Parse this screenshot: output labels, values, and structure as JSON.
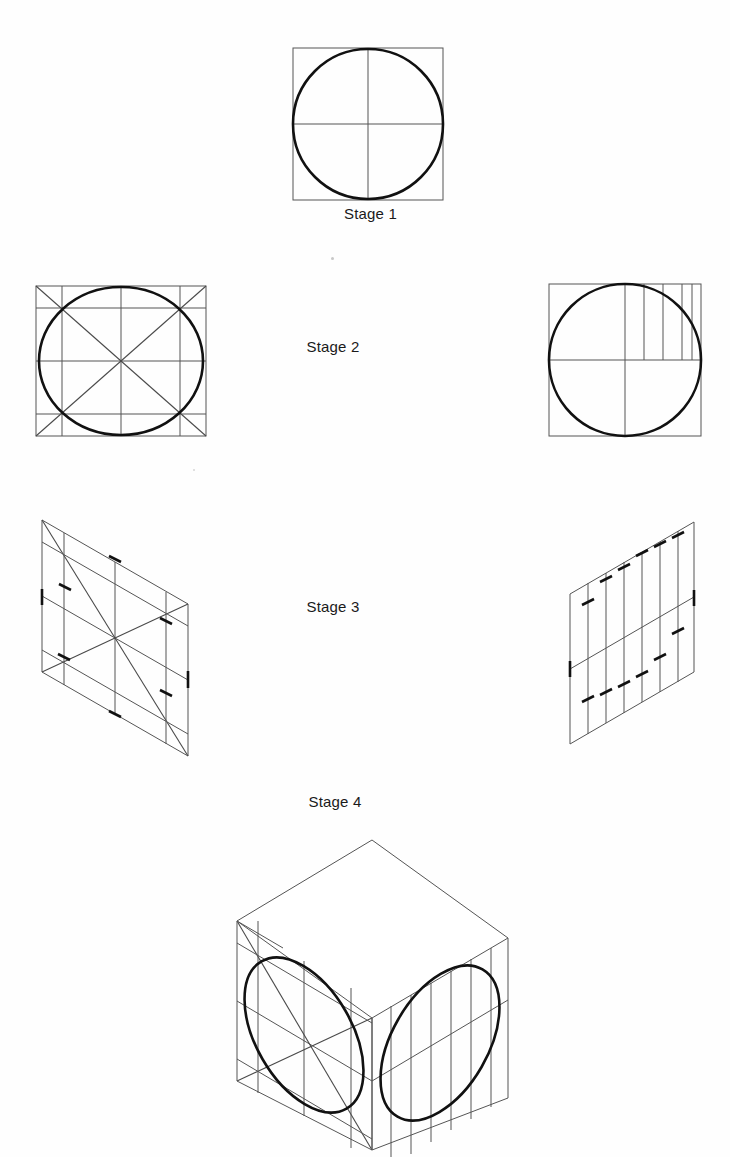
{
  "document": {
    "type": "technical-drawing",
    "subject": "Isometric circle construction by the ordinate (offset) method",
    "background_color": "#fefefe",
    "thin_line_color": "#555555",
    "thick_line_color": "#111111",
    "width": 730,
    "height": 1157
  },
  "stages": [
    {
      "id": "stage-1",
      "label": "Stage 1",
      "description": "True-view square with inscribed circle and centre lines",
      "label_x": 333,
      "label_y": 212,
      "square": {
        "x": 293,
        "y": 48,
        "size": 150
      },
      "circle": {
        "cx": 368,
        "cy": 123,
        "r": 75
      },
      "center_lines": 2
    },
    {
      "id": "stage-2-left",
      "label": "Stage 2",
      "description": "Square with circle, diagonals and corner offset grid",
      "square": {
        "x": 36,
        "y": 286,
        "size": 170
      },
      "circle": {
        "cx": 121,
        "cy": 371,
        "r": 80
      },
      "diagonals": 2,
      "offset_lines": 4
    },
    {
      "id": "stage-2-right",
      "label": "Stage 2",
      "description": "Square with circle, centre lines and vertical ordinates in upper-right quadrant",
      "square": {
        "x": 549,
        "y": 284,
        "size": 152
      },
      "circle": {
        "cx": 625,
        "cy": 360,
        "r": 76
      },
      "ordinates": 4
    },
    {
      "id": "stage-2-center-label",
      "label": "Stage 2",
      "label_x": 333,
      "label_y": 345
    },
    {
      "id": "stage-3-left",
      "label": "Stage 3",
      "description": "Isometric (left-face) rhombus with transferred grid, diagonals and ordinate tick marks",
      "tick_count": 8
    },
    {
      "id": "stage-3-right",
      "label": "Stage 3",
      "description": "Isometric (right-face) rhombus with transferred vertical ordinates and tick marks",
      "tick_count": 12
    },
    {
      "id": "stage-3-center-label",
      "label": "Stage 3",
      "label_x": 333,
      "label_y": 605
    },
    {
      "id": "stage-4",
      "label": "Stage 4",
      "description": "Finished isometric cube with ellipses plotted on the left and right faces",
      "label_x": 335,
      "label_y": 800,
      "top_vertex": {
        "x": 372,
        "y": 840
      },
      "bottom_vertex": {
        "x": 372,
        "y": 1150
      },
      "left_vertex": {
        "x": 237,
        "y": 921
      },
      "right_vertex": {
        "x": 508,
        "y": 938
      },
      "ellipse_count": 2
    }
  ],
  "labels": {
    "stage1": "Stage 1",
    "stage2": "Stage 2",
    "stage3": "Stage 3",
    "stage4": "Stage 4"
  }
}
